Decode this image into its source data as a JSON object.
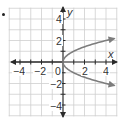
{
  "chart_data": {
    "type": "line",
    "title": "",
    "xlabel": "x",
    "ylabel": "y",
    "xlim": [
      -5,
      5
    ],
    "ylim": [
      -5,
      5
    ],
    "grid": true,
    "x_ticks": [
      -4,
      -2,
      0,
      2,
      4
    ],
    "y_ticks": [
      4,
      2,
      -2,
      -4
    ],
    "x_tick_labels": [
      "−4",
      "−2",
      "0",
      "2",
      "4"
    ],
    "y_tick_labels": [
      "4",
      "2",
      "−2",
      "−4"
    ],
    "series": [
      {
        "name": "upper branch y = √x",
        "x": [
          0,
          0.25,
          1,
          2,
          3,
          4,
          4.8
        ],
        "y": [
          0,
          0.5,
          1,
          1.41,
          1.73,
          2,
          2.19
        ]
      },
      {
        "name": "lower branch y = −√x",
        "x": [
          0,
          0.25,
          1,
          2,
          3,
          4,
          4.8
        ],
        "y": [
          0,
          -0.5,
          -1,
          -1.41,
          -1.73,
          -2,
          -2.19
        ]
      }
    ],
    "relation": "x = y^2",
    "colors": {
      "grid": "#cfcfcf",
      "axes": "#2a2a2a",
      "curve": "#7d7d7d",
      "text": "#333333"
    }
  },
  "labels": {
    "x_axis": "x",
    "y_axis": "y",
    "origin": "0",
    "x_neg4": "−4",
    "x_neg2": "−2",
    "x_pos2": "2",
    "x_pos4": "4",
    "y_pos4": "4",
    "y_pos2": "2",
    "y_neg2": "−2",
    "y_neg4": "−4"
  }
}
